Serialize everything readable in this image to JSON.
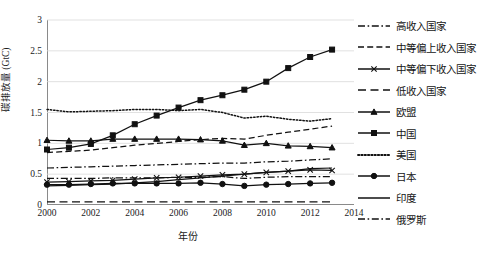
{
  "chart_data": {
    "type": "line",
    "title": "",
    "xlabel": "年份",
    "ylabel": "碳排放量 (GtC)",
    "xlim": [
      2000,
      2014
    ],
    "ylim": [
      0,
      3
    ],
    "xticks": [
      "2000",
      "2002",
      "2004",
      "2006",
      "2008",
      "2010",
      "2012",
      "2014"
    ],
    "yticks": [
      "0",
      "0.5",
      "1",
      "1.5",
      "2",
      "2.5",
      "3"
    ],
    "grid": "horizontal",
    "legend_position": "right",
    "x": [
      2000,
      2001,
      2002,
      2003,
      2004,
      2005,
      2006,
      2007,
      2008,
      2009,
      2010,
      2011,
      2012,
      2013
    ],
    "series": [
      {
        "name": "高收入国家",
        "style": "dash-dot",
        "marker": "none",
        "color": "#111111",
        "values": [
          0.6,
          0.61,
          0.62,
          0.63,
          0.64,
          0.65,
          0.66,
          0.67,
          0.68,
          0.68,
          0.7,
          0.71,
          0.73,
          0.75
        ]
      },
      {
        "name": "中等偏上收入国家",
        "style": "dashed",
        "marker": "none",
        "color": "#111111",
        "values": [
          0.85,
          0.87,
          0.89,
          0.93,
          0.97,
          1.0,
          1.03,
          1.06,
          1.08,
          1.07,
          1.13,
          1.18,
          1.23,
          1.28
        ]
      },
      {
        "name": "中等偏下收入国家",
        "style": "solid",
        "marker": "cross",
        "color": "#111111",
        "values": [
          0.37,
          0.38,
          0.39,
          0.4,
          0.42,
          0.44,
          0.45,
          0.47,
          0.49,
          0.5,
          0.53,
          0.55,
          0.57,
          0.56
        ]
      },
      {
        "name": "低收入国家",
        "style": "long-dash",
        "marker": "none",
        "color": "#111111",
        "values": [
          0.05,
          0.05,
          0.05,
          0.05,
          0.05,
          0.05,
          0.05,
          0.05,
          0.05,
          0.05,
          0.05,
          0.05,
          0.05,
          0.05
        ]
      },
      {
        "name": "欧盟",
        "style": "solid",
        "marker": "triangle",
        "color": "#111111",
        "values": [
          1.05,
          1.04,
          1.04,
          1.07,
          1.07,
          1.07,
          1.07,
          1.06,
          1.04,
          0.97,
          1.0,
          0.96,
          0.95,
          0.93
        ]
      },
      {
        "name": "中国",
        "style": "solid",
        "marker": "square",
        "color": "#111111",
        "values": [
          0.9,
          0.93,
          0.99,
          1.13,
          1.31,
          1.45,
          1.58,
          1.7,
          1.78,
          1.87,
          1.98,
          2.2,
          2.32,
          2.4
        ]
      },
      {
        "name": "美国",
        "style": "dotted",
        "marker": "none",
        "color": "#111111",
        "values": [
          1.55,
          1.51,
          1.52,
          1.53,
          1.55,
          1.55,
          1.53,
          1.55,
          1.5,
          1.41,
          1.44,
          1.39,
          1.36,
          1.4
        ]
      },
      {
        "name": "日本",
        "style": "solid",
        "marker": "circle",
        "color": "#111111",
        "values": [
          0.33,
          0.33,
          0.34,
          0.35,
          0.35,
          0.35,
          0.35,
          0.36,
          0.34,
          0.31,
          0.33,
          0.34,
          0.35,
          0.36
        ]
      },
      {
        "name": "印度",
        "style": "solid",
        "marker": "none",
        "color": "#111111",
        "values": [
          0.31,
          0.32,
          0.33,
          0.34,
          0.36,
          0.38,
          0.41,
          0.44,
          0.47,
          0.5,
          0.53,
          0.55,
          0.59,
          0.6
        ]
      },
      {
        "name": "俄罗斯",
        "style": "dash-dot",
        "marker": "none",
        "color": "#111111",
        "values": [
          0.43,
          0.43,
          0.43,
          0.44,
          0.44,
          0.44,
          0.45,
          0.45,
          0.46,
          0.43,
          0.45,
          0.46,
          0.46,
          0.46
        ]
      }
    ],
    "china_override": {
      "note": "中国 rendered values",
      "values": [
        0.9,
        0.93,
        0.99,
        1.13,
        1.31,
        1.45,
        1.58,
        1.7,
        1.78,
        1.87,
        2.0,
        2.22,
        2.4,
        2.52
      ]
    }
  }
}
